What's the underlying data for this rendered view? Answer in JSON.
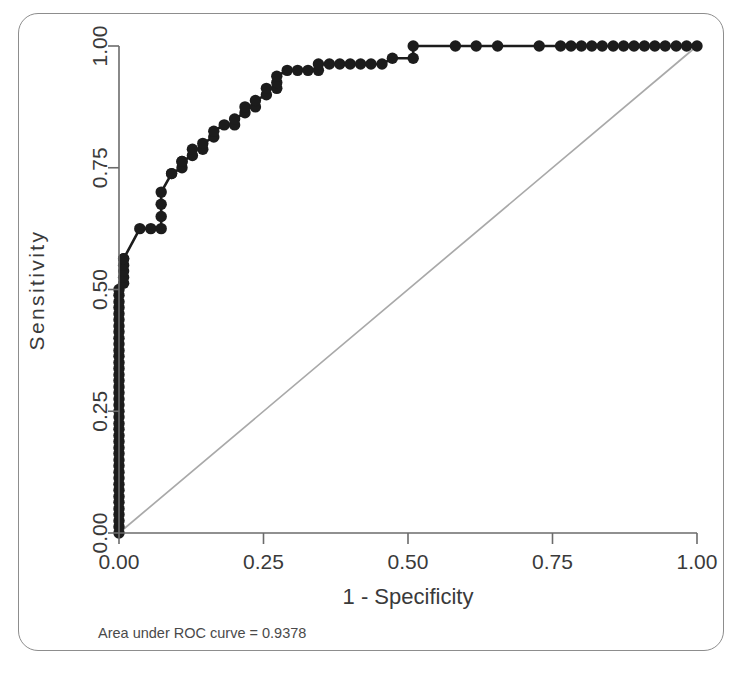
{
  "figure": {
    "frame_border_color": "#8d8d8d",
    "background": "#ffffff",
    "footnote": "Area under ROC curve = 0.9378"
  },
  "axes": {
    "x_title": "1 - Specificity",
    "y_title": "Sensitivity",
    "x_ticks": [
      "0.00",
      "0.25",
      "0.50",
      "0.75",
      "1.00"
    ],
    "y_ticks": [
      "0.00",
      "0.25",
      "0.50",
      "0.75",
      "1.00"
    ],
    "axis_color": "#6b6b6b",
    "label_color": "#3a3a3a"
  },
  "chart_data": {
    "type": "line",
    "title": "",
    "subtitle": "",
    "xlabel": "1 - Specificity",
    "ylabel": "Sensitivity",
    "xlim": [
      0.0,
      1.0
    ],
    "ylim": [
      0.0,
      1.0
    ],
    "xticks": [
      0.0,
      0.25,
      0.5,
      0.75,
      1.0
    ],
    "yticks": [
      0.0,
      0.25,
      0.5,
      0.75,
      1.0
    ],
    "grid": false,
    "legend": null,
    "annotations": [
      "Area under ROC curve = 0.9378"
    ],
    "auc": 0.9378,
    "series": [
      {
        "name": "ROC curve",
        "color": "#1c1c1c",
        "marker": "circle",
        "marker_size": 7,
        "line_width": 2.6,
        "x": [
          0.0,
          0.0,
          0.0,
          0.0,
          0.0,
          0.0,
          0.0,
          0.0,
          0.0,
          0.0,
          0.0,
          0.0,
          0.0,
          0.0,
          0.0,
          0.0,
          0.0,
          0.0,
          0.0,
          0.0,
          0.0,
          0.0,
          0.0,
          0.0,
          0.0,
          0.0,
          0.0,
          0.0,
          0.0,
          0.0,
          0.0,
          0.0,
          0.0,
          0.0,
          0.0,
          0.0,
          0.0,
          0.0,
          0.0,
          0.0,
          0.0,
          0.008,
          0.008,
          0.008,
          0.008,
          0.008,
          0.008,
          0.036,
          0.055,
          0.073,
          0.073,
          0.073,
          0.073,
          0.091,
          0.091,
          0.109,
          0.109,
          0.109,
          0.127,
          0.127,
          0.145,
          0.145,
          0.164,
          0.164,
          0.182,
          0.2,
          0.2,
          0.218,
          0.218,
          0.236,
          0.236,
          0.255,
          0.255,
          0.273,
          0.273,
          0.273,
          0.291,
          0.309,
          0.327,
          0.345,
          0.345,
          0.364,
          0.382,
          0.4,
          0.418,
          0.436,
          0.455,
          0.473,
          0.509,
          0.509,
          0.582,
          0.618,
          0.655,
          0.727,
          0.764,
          0.782,
          0.8,
          0.818,
          0.836,
          0.855,
          0.873,
          0.891,
          0.909,
          0.927,
          0.945,
          0.964,
          0.982,
          1.0
        ],
        "y": [
          0.0,
          0.013,
          0.025,
          0.038,
          0.05,
          0.063,
          0.075,
          0.088,
          0.1,
          0.113,
          0.125,
          0.138,
          0.15,
          0.163,
          0.175,
          0.188,
          0.2,
          0.213,
          0.225,
          0.238,
          0.25,
          0.263,
          0.275,
          0.288,
          0.3,
          0.313,
          0.325,
          0.338,
          0.35,
          0.363,
          0.375,
          0.388,
          0.4,
          0.413,
          0.425,
          0.438,
          0.45,
          0.463,
          0.475,
          0.488,
          0.5,
          0.513,
          0.525,
          0.538,
          0.55,
          0.563,
          0.563,
          0.625,
          0.625,
          0.625,
          0.65,
          0.675,
          0.7,
          0.738,
          0.738,
          0.75,
          0.763,
          0.763,
          0.775,
          0.788,
          0.788,
          0.8,
          0.813,
          0.825,
          0.838,
          0.838,
          0.85,
          0.863,
          0.875,
          0.875,
          0.888,
          0.9,
          0.913,
          0.913,
          0.925,
          0.938,
          0.95,
          0.95,
          0.95,
          0.95,
          0.963,
          0.963,
          0.963,
          0.963,
          0.963,
          0.963,
          0.963,
          0.975,
          0.975,
          1.0,
          1.0,
          1.0,
          1.0,
          1.0,
          1.0,
          1.0,
          1.0,
          1.0,
          1.0,
          1.0,
          1.0,
          1.0,
          1.0,
          1.0,
          1.0,
          1.0,
          1.0,
          1.0
        ]
      },
      {
        "name": "Reference diagonal",
        "color": "#a9a9a9",
        "marker": "none",
        "line_width": 1.7,
        "x": [
          0.0,
          1.0
        ],
        "y": [
          0.0,
          1.0
        ]
      }
    ]
  }
}
